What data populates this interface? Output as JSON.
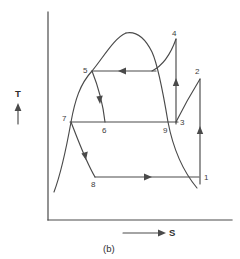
{
  "figure": {
    "caption": "(b)",
    "axes": {
      "y_label": "T",
      "x_label": "S",
      "y_label_name": "temperature-axis-label",
      "x_label_name": "entropy-axis-label"
    },
    "diagram_type": "temperature-entropy-diagram",
    "line_color": "#4a4a4a",
    "background_color": "#ffffff",
    "state_points": [
      {
        "id": "1",
        "label": "1",
        "x": 200,
        "y": 182
      },
      {
        "id": "2",
        "label": "2",
        "x": 200,
        "y": 77
      },
      {
        "id": "3",
        "label": "3",
        "x": 179,
        "y": 122
      },
      {
        "id": "4",
        "label": "4",
        "x": 176,
        "y": 38
      },
      {
        "id": "5",
        "label": "5",
        "x": 92,
        "y": 71
      },
      {
        "id": "6",
        "label": "6",
        "x": 105,
        "y": 122
      },
      {
        "id": "7",
        "label": "7",
        "x": 71,
        "y": 122
      },
      {
        "id": "8",
        "label": "8",
        "x": 95,
        "y": 177
      },
      {
        "id": "9",
        "label": "9",
        "x": 168,
        "y": 122
      }
    ],
    "label_positions": [
      {
        "name": "point-label-1",
        "text": "1",
        "x": 204,
        "y": 180
      },
      {
        "name": "point-label-2",
        "text": "2",
        "x": 196,
        "y": 74
      },
      {
        "name": "point-label-3",
        "text": "3",
        "x": 180,
        "y": 124
      },
      {
        "name": "point-label-4",
        "text": "4",
        "x": 172,
        "y": 36
      },
      {
        "name": "point-label-5",
        "text": "5",
        "x": 84,
        "y": 71
      },
      {
        "name": "point-label-6",
        "text": "6",
        "x": 102,
        "y": 132
      },
      {
        "name": "point-label-7",
        "text": "7",
        "x": 63,
        "y": 121
      },
      {
        "name": "point-label-8",
        "text": "8",
        "x": 92,
        "y": 186
      },
      {
        "name": "point-label-9",
        "text": "9",
        "x": 164,
        "y": 132
      }
    ],
    "process_lines": [
      {
        "name": "process-5-to-4-isobar",
        "from": "5",
        "to": "4",
        "direction": "leftward"
      },
      {
        "name": "process-7-to-9-isobar",
        "from": "7",
        "to": "9",
        "direction": "none"
      },
      {
        "name": "process-8-to-1-isobar",
        "from": "8",
        "to": "1",
        "direction": "rightward"
      },
      {
        "name": "process-1-to-2-compression",
        "from": "1",
        "to": "2",
        "direction": "upward"
      },
      {
        "name": "process-3-to-4-compression",
        "from": "3",
        "to": "4",
        "direction": "upward"
      },
      {
        "name": "process-5-to-6-expansion",
        "from": "5",
        "to": "6",
        "direction": "downward"
      },
      {
        "name": "process-7-to-8-expansion",
        "from": "7",
        "to": "8",
        "direction": "downward"
      },
      {
        "name": "process-2-to-3-condensation",
        "from": "2",
        "to": "3",
        "direction": "none"
      },
      {
        "name": "saturation-dome",
        "from": "",
        "to": "",
        "direction": "none"
      }
    ]
  }
}
